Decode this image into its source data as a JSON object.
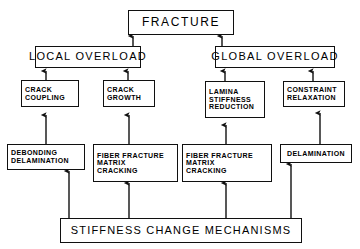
{
  "diagram": {
    "title": "FRACTURE",
    "type": "flowchart",
    "direction": "bottom-up",
    "background_color": "#ffffff",
    "line_color": "#101010",
    "text_color": "#000000",
    "nodes": [
      {
        "id": "fracture",
        "lines": [
          "FRACTURE"
        ]
      },
      {
        "id": "local",
        "lines": [
          "LOCAL  OVERLOAD"
        ]
      },
      {
        "id": "global",
        "lines": [
          "GLOBAL  OVERLOAD"
        ]
      },
      {
        "id": "crack_coupling",
        "lines": [
          "CRACK",
          "COUPLING"
        ]
      },
      {
        "id": "crack_growth",
        "lines": [
          "CRACK",
          "GROWTH"
        ]
      },
      {
        "id": "lamina",
        "lines": [
          "LAMINA",
          "STIFFNESS",
          "REDUCTION"
        ]
      },
      {
        "id": "constraint",
        "lines": [
          "CONSTRAINT",
          "RELAXATION"
        ]
      },
      {
        "id": "debonding",
        "lines": [
          "DEBONDING",
          "DELAMINATION"
        ]
      },
      {
        "id": "fiber_left",
        "lines": [
          "FIBER  FRACTURE",
          "MATRIX",
          "CRACKING"
        ]
      },
      {
        "id": "fiber_right",
        "lines": [
          "FIBER  FRACTURE",
          "MATRIX",
          "CRACKING"
        ]
      },
      {
        "id": "delamination",
        "lines": [
          "DELAMINATION"
        ]
      },
      {
        "id": "stiffness",
        "lines": [
          "STIFFNESS  CHANGE  MECHANISMS"
        ]
      }
    ],
    "edges": [
      {
        "from": "local",
        "to": "fracture"
      },
      {
        "from": "global",
        "to": "fracture"
      },
      {
        "from": "crack_coupling",
        "to": "local"
      },
      {
        "from": "crack_growth",
        "to": "local"
      },
      {
        "from": "lamina",
        "to": "global"
      },
      {
        "from": "constraint",
        "to": "global"
      },
      {
        "from": "debonding",
        "to": "crack_coupling"
      },
      {
        "from": "fiber_left",
        "to": "crack_growth"
      },
      {
        "from": "fiber_right",
        "to": "lamina"
      },
      {
        "from": "delamination",
        "to": "constraint"
      },
      {
        "from": "stiffness",
        "to": "debonding"
      },
      {
        "from": "stiffness",
        "to": "fiber_left"
      },
      {
        "from": "stiffness",
        "to": "fiber_right"
      },
      {
        "from": "stiffness",
        "to": "delamination"
      }
    ]
  }
}
